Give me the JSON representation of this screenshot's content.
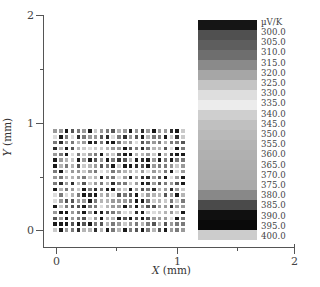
{
  "chart_data": {
    "type": "heatmap",
    "title": "",
    "xlabel": "X (mm)",
    "ylabel": "Y (mm)",
    "xlim": [
      0,
      2
    ],
    "ylim": [
      0,
      2
    ],
    "x_ticks": [
      "0",
      "1",
      "2"
    ],
    "y_ticks": [
      "0",
      "1",
      "2"
    ],
    "grid": false,
    "scatter_grid": {
      "description": "Regular grid of small square markers shaded by Seebeck coefficient",
      "x_range_mm": [
        0.0,
        1.05
      ],
      "y_range_mm": [
        0.0,
        0.88
      ],
      "columns": 23,
      "rows": 18
    },
    "colorbar": {
      "unit": "µV/K",
      "position": "right",
      "levels": [
        "300.0",
        "305.0",
        "310.0",
        "315.0",
        "320.0",
        "325.0",
        "330.0",
        "335.0",
        "340.0",
        "345.0",
        "350.0",
        "355.0",
        "360.0",
        "365.0",
        "370.0",
        "375.0",
        "380.0",
        "385.0",
        "390.0",
        "395.0",
        "400.0"
      ],
      "segment_colors": [
        "#151515",
        "#505050",
        "#5e5e5e",
        "#6e6e6e",
        "#8a8a8a",
        "#a6a6a6",
        "#c4c4c4",
        "#dedede",
        "#ececec",
        "#cfcfcf",
        "#c0c0c0",
        "#b9b9b9",
        "#b4b4b4",
        "#b0b0b0",
        "#adadad",
        "#ababab",
        "#a9a9a9",
        "#888888",
        "#4a4a4a",
        "#101010",
        "#0a0a0a",
        "#cccccc"
      ]
    }
  },
  "axes": {
    "x_tick_labels": [
      "0",
      "1",
      "2"
    ],
    "y_tick_labels": [
      "0",
      "1",
      "2"
    ],
    "x_title_var": "X",
    "x_title_unit": " (mm)",
    "y_title_var": "Y",
    "y_title_unit": " (mm)"
  }
}
